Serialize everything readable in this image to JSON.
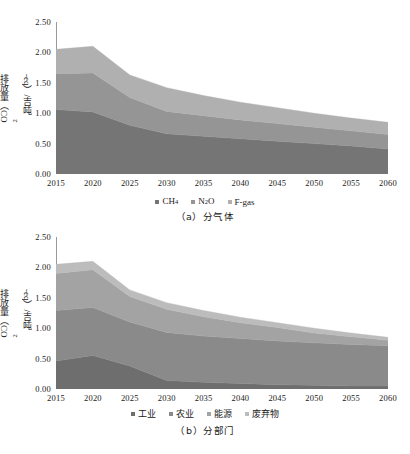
{
  "figure": {
    "panels": [
      {
        "id": "panel-a",
        "caption": "（a）分气体",
        "ylabel_pre": "排放量（CO",
        "ylabel_sub": "2",
        "ylabel_post": "-eq）/吉吨",
        "yticks": [
          "0.00",
          "0.50",
          "1.00",
          "1.50",
          "2.00",
          "2.50"
        ],
        "xticks": [
          "2015",
          "2020",
          "2025",
          "2030",
          "2035",
          "2040",
          "2045",
          "2050",
          "2055",
          "2060"
        ],
        "legend": [
          {
            "label": "CH",
            "sub": "4",
            "post": "",
            "color": "#757575"
          },
          {
            "label": "N",
            "sub": "2",
            "post": "O",
            "color": "#959595"
          },
          {
            "label": "F-gas",
            "sub": "",
            "post": "",
            "color": "#b0b0b0"
          }
        ]
      },
      {
        "id": "panel-b",
        "caption": "（b）分部门",
        "ylabel_pre": "排放量（CO",
        "ylabel_sub": "2",
        "ylabel_post": "-eq）/吉吨",
        "yticks": [
          "0.00",
          "0.50",
          "1.00",
          "1.50",
          "2.00",
          "2.50"
        ],
        "xticks": [
          "2015",
          "2020",
          "2025",
          "2030",
          "2035",
          "2040",
          "2045",
          "2050",
          "2055",
          "2060"
        ],
        "legend": [
          {
            "label": "工业",
            "sub": "",
            "post": "",
            "color": "#6e6e6e"
          },
          {
            "label": "农业",
            "sub": "",
            "post": "",
            "color": "#8a8a8a"
          },
          {
            "label": "能源",
            "sub": "",
            "post": "",
            "color": "#a3a3a3"
          },
          {
            "label": "废弃物",
            "sub": "",
            "post": "",
            "color": "#bcbcbc"
          }
        ]
      }
    ]
  },
  "chart_data": [
    {
      "type": "area",
      "stacked": true,
      "id": "panel-a",
      "title": "（a）分气体",
      "xlabel": "",
      "ylabel": "排放量（CO2-eq）/吉吨",
      "ylim": [
        0,
        2.5
      ],
      "xlim": [
        2015,
        2060
      ],
      "grid": false,
      "legend_position": "bottom",
      "x": [
        2015,
        2020,
        2025,
        2030,
        2035,
        2040,
        2045,
        2050,
        2055,
        2060
      ],
      "categories": [
        "2015",
        "2020",
        "2025",
        "2030",
        "2035",
        "2040",
        "2045",
        "2050",
        "2055",
        "2060"
      ],
      "series": [
        {
          "name": "CH4",
          "color": "#757575",
          "values": [
            1.06,
            1.02,
            0.8,
            0.66,
            0.62,
            0.58,
            0.54,
            0.5,
            0.46,
            0.41
          ]
        },
        {
          "name": "N2O",
          "color": "#959595",
          "values": [
            0.59,
            0.64,
            0.46,
            0.37,
            0.34,
            0.31,
            0.29,
            0.27,
            0.25,
            0.24
          ]
        },
        {
          "name": "F-gas",
          "color": "#b0b0b0",
          "values": [
            0.4,
            0.44,
            0.37,
            0.39,
            0.33,
            0.29,
            0.26,
            0.23,
            0.21,
            0.2
          ]
        }
      ],
      "totals": [
        2.05,
        2.1,
        1.63,
        1.42,
        1.29,
        1.18,
        1.09,
        1.0,
        0.92,
        0.85
      ]
    },
    {
      "type": "area",
      "stacked": true,
      "id": "panel-b",
      "title": "（b）分部门",
      "xlabel": "",
      "ylabel": "排放量（CO2-eq）/吉吨",
      "ylim": [
        0,
        2.5
      ],
      "xlim": [
        2015,
        2060
      ],
      "grid": false,
      "legend_position": "bottom",
      "x": [
        2015,
        2020,
        2025,
        2030,
        2035,
        2040,
        2045,
        2050,
        2055,
        2060
      ],
      "categories": [
        "2015",
        "2020",
        "2025",
        "2030",
        "2035",
        "2040",
        "2045",
        "2050",
        "2055",
        "2060"
      ],
      "series": [
        {
          "name": "工业",
          "color": "#6e6e6e",
          "values": [
            0.46,
            0.55,
            0.38,
            0.14,
            0.11,
            0.09,
            0.07,
            0.06,
            0.05,
            0.05
          ]
        },
        {
          "name": "农业",
          "color": "#8a8a8a",
          "values": [
            0.83,
            0.79,
            0.72,
            0.79,
            0.76,
            0.74,
            0.72,
            0.7,
            0.68,
            0.66
          ]
        },
        {
          "name": "能源",
          "color": "#a3a3a3",
          "values": [
            0.61,
            0.62,
            0.42,
            0.38,
            0.32,
            0.26,
            0.22,
            0.16,
            0.13,
            0.09
          ]
        },
        {
          "name": "废弃物",
          "color": "#bcbcbc",
          "values": [
            0.15,
            0.14,
            0.11,
            0.11,
            0.1,
            0.09,
            0.08,
            0.08,
            0.06,
            0.05
          ]
        }
      ],
      "totals": [
        2.05,
        2.1,
        1.63,
        1.42,
        1.29,
        1.18,
        1.09,
        1.0,
        0.92,
        0.85
      ]
    }
  ]
}
